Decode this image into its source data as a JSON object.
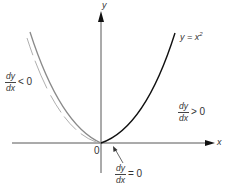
{
  "diagram": {
    "axes": {
      "x_label": "x",
      "y_label": "y",
      "origin_label": "0"
    },
    "curve": {
      "equation_lhs": "y = x",
      "equation_exp": "2",
      "type": "parabola"
    },
    "annotations": {
      "left": {
        "num": "dy",
        "den": "dx",
        "relation": "< 0"
      },
      "right": {
        "num": "dy",
        "den": "dx",
        "relation": "> 0"
      },
      "bottom": {
        "num": "dy",
        "den": "dx",
        "relation": "= 0"
      }
    },
    "colors": {
      "axis": "#333333",
      "curve_left": "#888888",
      "curve_right": "#111111",
      "text": "#333333"
    }
  }
}
